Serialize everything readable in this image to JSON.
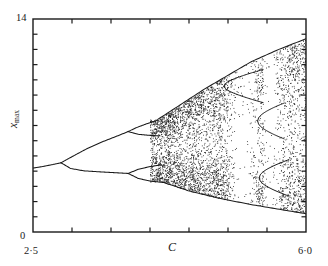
{
  "figure": {
    "kind": "bifurcation-diagram"
  },
  "axes": {
    "x_title": "C",
    "y_title_base": "x",
    "y_title_sub": "max",
    "x_left_label": "2·5",
    "x_right_label": "6·0",
    "y_bottom_label": "0",
    "y_top_label": "14"
  },
  "chart_data": {
    "type": "scatter",
    "title": "",
    "subtitle": "",
    "xlabel": "C",
    "ylabel": "x_max",
    "xlim": [
      2.5,
      6.0
    ],
    "ylim": [
      0,
      14
    ],
    "grid": false,
    "legend": null,
    "x_ticks": [
      2.5,
      3.0,
      3.5,
      4.0,
      4.5,
      5.0,
      5.5,
      6.0
    ],
    "x_tick_labels": [
      "2·5",
      "",
      "",
      "",
      "",
      "",
      "",
      "6·0"
    ],
    "y_ticks": [
      0,
      1,
      2,
      3,
      4,
      5,
      6,
      7,
      8,
      9,
      10,
      11,
      12,
      13,
      14
    ],
    "y_tick_labels": [
      "0",
      "",
      "",
      "",
      "",
      "",
      "",
      "",
      "",
      "",
      "",
      "",
      "",
      "",
      "14"
    ],
    "annotations": [],
    "features": {
      "fixed_point_start": {
        "C": 2.5,
        "x_max": 4.2
      },
      "first_bifurcation": {
        "C": 2.86,
        "x_max": 4.55
      },
      "second_bifurcation_upper": {
        "C": 3.72,
        "x_max": 6.6
      },
      "second_bifurcation_lower": {
        "C": 3.72,
        "x_max": 3.85
      },
      "chaos_onset": {
        "C": 4.0
      },
      "upper_envelope_right": {
        "C": 6.0,
        "x_max": 12.6
      },
      "lower_envelope_right": {
        "C": 6.0,
        "x_max": 1.2
      },
      "periodic_windows": [
        {
          "C_start": 4.95,
          "C_end": 5.45,
          "period": 3
        },
        {
          "C_start": 5.38,
          "C_end": 5.72,
          "period": 3
        },
        {
          "C_start": 5.4,
          "C_end": 5.78,
          "period": 3
        }
      ]
    },
    "branches": [
      {
        "name": "fixed-point",
        "points": [
          [
            2.5,
            4.2
          ],
          [
            2.62,
            4.3
          ],
          [
            2.74,
            4.42
          ],
          [
            2.86,
            4.55
          ]
        ]
      },
      {
        "name": "period2-upper",
        "points": [
          [
            2.86,
            4.55
          ],
          [
            3.0,
            4.95
          ],
          [
            3.2,
            5.5
          ],
          [
            3.4,
            5.95
          ],
          [
            3.6,
            6.35
          ],
          [
            3.72,
            6.6
          ]
        ]
      },
      {
        "name": "period2-lower",
        "points": [
          [
            2.86,
            4.55
          ],
          [
            2.98,
            4.18
          ],
          [
            3.15,
            4.02
          ],
          [
            3.4,
            3.94
          ],
          [
            3.72,
            3.85
          ]
        ]
      },
      {
        "name": "period4-upper-a",
        "points": [
          [
            3.72,
            6.6
          ],
          [
            3.82,
            6.85
          ],
          [
            3.95,
            7.1
          ],
          [
            4.1,
            7.35
          ]
        ]
      },
      {
        "name": "period4-upper-b",
        "points": [
          [
            3.72,
            6.6
          ],
          [
            3.85,
            6.42
          ],
          [
            4.0,
            6.35
          ],
          [
            4.12,
            6.32
          ]
        ]
      },
      {
        "name": "period4-lower-a",
        "points": [
          [
            3.72,
            3.85
          ],
          [
            3.85,
            4.12
          ],
          [
            4.0,
            4.3
          ],
          [
            4.15,
            4.42
          ]
        ]
      },
      {
        "name": "period4-lower-b",
        "points": [
          [
            3.72,
            3.85
          ],
          [
            3.85,
            3.52
          ],
          [
            4.0,
            3.35
          ],
          [
            4.18,
            3.25
          ]
        ]
      },
      {
        "name": "chaos-upper-envelope",
        "points": [
          [
            4.1,
            7.4
          ],
          [
            4.4,
            8.4
          ],
          [
            4.7,
            9.4
          ],
          [
            5.0,
            10.3
          ],
          [
            5.3,
            11.2
          ],
          [
            5.65,
            12.0
          ],
          [
            6.0,
            12.7
          ]
        ]
      },
      {
        "name": "chaos-lower-envelope",
        "points": [
          [
            4.15,
            3.3
          ],
          [
            4.5,
            2.7
          ],
          [
            4.9,
            2.2
          ],
          [
            5.3,
            1.8
          ],
          [
            5.65,
            1.5
          ],
          [
            6.0,
            1.2
          ]
        ]
      }
    ]
  }
}
